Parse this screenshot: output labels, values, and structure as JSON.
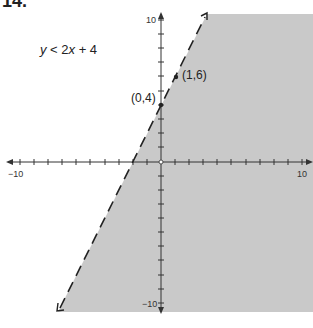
{
  "problem": {
    "number": "14.",
    "inequality": "y < 2x + 4"
  },
  "graph": {
    "x_range": [
      -10,
      10
    ],
    "y_range": [
      -10,
      10
    ],
    "tick_labels": {
      "x_min": "−10",
      "x_max": "10",
      "y_max": "10",
      "y_min": "−10"
    },
    "boundary_line": {
      "equation": "y = 2x + 4",
      "style": "dashed"
    },
    "shaded_side": "below/right of line",
    "shade_color": "#c9c9c9",
    "points": [
      {
        "label": "(0,4)",
        "x": 0,
        "y": 4
      },
      {
        "label": "(1,6)",
        "x": 1,
        "y": 6
      }
    ]
  }
}
